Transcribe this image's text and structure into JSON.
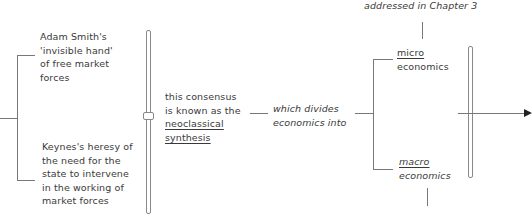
{
  "diagram": {
    "nodes": {
      "adam_smith": "Adam Smith's 'invisible hand' of free market forces",
      "keynes": "Keynes's heresy of the need for the state to intervene in the working of market forces",
      "consensus_prefix": "this consensus is known as the",
      "consensus_term_line1": "neoclassical",
      "consensus_term_line2": "synthesis",
      "divides": "which divides economics into",
      "micro_term": "micro",
      "micro_suffix": "economics",
      "macro_term": "macro",
      "macro_suffix": "economics",
      "chapter_note": "addressed in Chapter 3"
    },
    "edges": [
      {
        "from": "start",
        "to": "adam_smith"
      },
      {
        "from": "start",
        "to": "keynes"
      },
      {
        "from": "adam_smith+keynes",
        "to": "consensus"
      },
      {
        "from": "consensus",
        "to": "divides"
      },
      {
        "from": "divides",
        "to": "micro"
      },
      {
        "from": "divides",
        "to": "macro"
      },
      {
        "from": "micro",
        "to": "chapter_note"
      },
      {
        "from": "micro+macro",
        "to": "continuation-arrow"
      }
    ]
  }
}
